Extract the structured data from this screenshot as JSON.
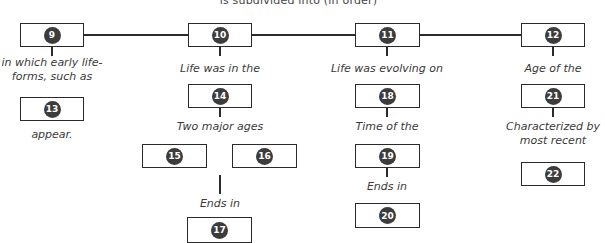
{
  "diagram": {
    "caption": "is subdivided into (in order)",
    "nodes": {
      "n9": "9",
      "n10": "10",
      "n11": "11",
      "n12": "12",
      "n13": "13",
      "n14": "14",
      "n15": "15",
      "n16": "16",
      "n17": "17",
      "n18": "18",
      "n19": "19",
      "n20": "20",
      "n21": "21",
      "n22": "22"
    },
    "labels": {
      "l9_line1": "in which early life-",
      "l9_line2": "forms, such as",
      "l13": "appear.",
      "l10": "Life was in the",
      "l14": "Two major ages",
      "l17": "Ends in",
      "l11": "Life was evolving on",
      "l18": "Time of the",
      "l19": "Ends in",
      "l12": "Age of the",
      "l21_line1": "Characterized by",
      "l21_line2": "most recent"
    },
    "colors": {
      "box_border": "#2b2b2b",
      "number_circle": "#3c3c3c",
      "text": "#3a3a3a"
    }
  }
}
